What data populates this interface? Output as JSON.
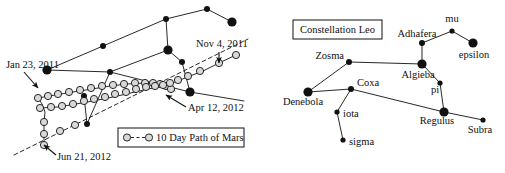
{
  "figure": {
    "background_color": "#ffffff",
    "ink_color": "#111111",
    "width": 505,
    "height": 173
  },
  "left_panel": {
    "name": "mars-path-panel",
    "date_labels": [
      {
        "id": "nov-4-2011",
        "text": "Nov 4, 2011",
        "x": 196,
        "y": 47,
        "anchor": "start",
        "arrow_from": [
          219,
          52
        ],
        "arrow_to": [
          219,
          63
        ]
      },
      {
        "id": "jan-23-2011",
        "text": "Jan 23, 2011",
        "x": 6,
        "y": 68,
        "anchor": "start",
        "arrow_from": [
          24,
          72
        ],
        "arrow_to": [
          38,
          88
        ]
      },
      {
        "id": "apr-12-2012",
        "text": "Apr 12, 2012",
        "x": 188,
        "y": 111,
        "anchor": "start",
        "arrow_from": [
          186,
          107
        ],
        "arrow_to": [
          166,
          95
        ]
      },
      {
        "id": "jun-21-2012",
        "text": "Jun 21, 2012",
        "x": 57,
        "y": 160,
        "anchor": "start",
        "arrow_from": [
          56,
          155
        ],
        "arrow_to": [
          44,
          145
        ]
      }
    ],
    "legend": {
      "label": "10 Day Path of Mars",
      "marker_style": "open-circle-dashed-open-circle",
      "box": {
        "x": 118,
        "y": 128,
        "width": 126,
        "height": 19
      }
    },
    "bright_stars": [
      {
        "id": "ls1",
        "x": 47,
        "y": 70,
        "r": 4.6
      },
      {
        "id": "ls2",
        "x": 103,
        "y": 46,
        "r": 3.0
      },
      {
        "id": "ls3",
        "x": 166,
        "y": 19,
        "r": 3.0
      },
      {
        "id": "ls4",
        "x": 207,
        "y": 9,
        "r": 3.0
      },
      {
        "id": "ls5",
        "x": 232,
        "y": 22,
        "r": 4.6
      },
      {
        "id": "ls6",
        "x": 168,
        "y": 50,
        "r": 4.6
      },
      {
        "id": "ls7",
        "x": 182,
        "y": 62,
        "r": 3.0
      },
      {
        "id": "ls8",
        "x": 190,
        "y": 92,
        "r": 4.6
      },
      {
        "id": "ls9",
        "x": 110,
        "y": 72,
        "r": 3.0
      },
      {
        "id": "ls10",
        "x": 84,
        "y": 96,
        "r": 3.0
      },
      {
        "id": "ls11",
        "x": 87,
        "y": 124,
        "r": 3.0
      }
    ],
    "constellation_segments": [
      [
        47,
        70,
        103,
        46
      ],
      [
        103,
        46,
        166,
        19
      ],
      [
        166,
        19,
        207,
        9
      ],
      [
        207,
        9,
        232,
        22
      ],
      [
        166,
        19,
        168,
        50
      ],
      [
        168,
        50,
        182,
        62
      ],
      [
        182,
        62,
        190,
        92
      ],
      [
        168,
        50,
        110,
        72
      ],
      [
        110,
        72,
        47,
        70
      ],
      [
        110,
        72,
        87,
        124
      ],
      [
        87,
        124,
        84,
        96
      ],
      [
        110,
        72,
        190,
        92
      ],
      [
        190,
        92,
        244,
        101
      ]
    ],
    "ecliptic": {
      "id": "ecliptic-dashed-line",
      "points": [
        [
          14,
          155
        ],
        [
          248,
          39
        ]
      ]
    },
    "mars_path_upper": [
      [
        38,
        98
      ],
      [
        55,
        95
      ],
      [
        73,
        92
      ],
      [
        92,
        89
      ],
      [
        110,
        86
      ],
      [
        127,
        84
      ],
      [
        144,
        83
      ],
      [
        157,
        83
      ],
      [
        166,
        85
      ],
      [
        172,
        88
      ],
      [
        175,
        91
      ]
    ],
    "mars_path_lower": [
      [
        40,
        108
      ],
      [
        58,
        107
      ],
      [
        76,
        104
      ],
      [
        93,
        101
      ],
      [
        108,
        98
      ],
      [
        122,
        95
      ],
      [
        135,
        92
      ],
      [
        148,
        89
      ],
      [
        158,
        87
      ],
      [
        166,
        85
      ],
      [
        172,
        83
      ],
      [
        180,
        80
      ],
      [
        190,
        76
      ],
      [
        203,
        71
      ],
      [
        219,
        63
      ],
      [
        236,
        55
      ]
    ],
    "mars_path_tail": [
      [
        38,
        98
      ],
      [
        42,
        104
      ],
      [
        45,
        112
      ],
      [
        44,
        122
      ],
      [
        44,
        134
      ],
      [
        44,
        145
      ]
    ],
    "mars_markers_upper": [
      [
        38,
        98
      ],
      [
        48,
        96
      ],
      [
        58,
        94
      ],
      [
        69,
        92
      ],
      [
        80,
        90
      ],
      [
        91,
        88
      ],
      [
        102,
        86
      ],
      [
        113,
        85
      ],
      [
        124,
        84
      ],
      [
        135,
        83
      ],
      [
        145,
        83
      ],
      [
        153,
        83
      ],
      [
        160,
        84
      ],
      [
        166,
        86
      ],
      [
        171,
        89
      ]
    ],
    "mars_markers_lower": [
      [
        40,
        108
      ],
      [
        51,
        107
      ],
      [
        62,
        106
      ],
      [
        73,
        104
      ],
      [
        84,
        101
      ],
      [
        94,
        99
      ],
      [
        105,
        97
      ],
      [
        115,
        94
      ],
      [
        126,
        92
      ],
      [
        136,
        89
      ],
      [
        146,
        87
      ],
      [
        155,
        86
      ],
      [
        163,
        85
      ],
      [
        170,
        83
      ],
      [
        178,
        80
      ],
      [
        188,
        76
      ],
      [
        200,
        71
      ],
      [
        219,
        63
      ],
      [
        236,
        55
      ]
    ],
    "mars_markers_tail": [
      [
        44,
        122
      ],
      [
        44,
        134
      ],
      [
        44,
        145
      ],
      [
        60,
        131
      ],
      [
        75,
        125
      ]
    ]
  },
  "right_panel": {
    "name": "constellation-leo-panel",
    "title": "Constellation Leo",
    "title_box": {
      "x": 293,
      "y": 20,
      "width": 89,
      "height": 19
    },
    "stars": [
      {
        "name": "Zosma",
        "x": 349,
        "y": 62,
        "r": 3.0,
        "label_x": 344,
        "label_y": 59,
        "label_anchor": "end",
        "magnitude": "bright"
      },
      {
        "name": "Denebola",
        "x": 308,
        "y": 92,
        "r": 4.6,
        "label_x": 303,
        "label_y": 105,
        "label_anchor": "middle",
        "magnitude": "bright"
      },
      {
        "name": "Coxa",
        "x": 351,
        "y": 89,
        "r": 3.0,
        "label_x": 357,
        "label_y": 86,
        "label_anchor": "start",
        "magnitude": "medium"
      },
      {
        "name": "iota",
        "x": 337,
        "y": 112,
        "r": 2.6,
        "label_x": 343,
        "label_y": 117,
        "label_anchor": "start",
        "magnitude": "small"
      },
      {
        "name": "sigma",
        "x": 343,
        "y": 140,
        "r": 2.6,
        "label_x": 349,
        "label_y": 145,
        "label_anchor": "start",
        "magnitude": "small"
      },
      {
        "name": "Algieba",
        "x": 422,
        "y": 64,
        "r": 4.6,
        "label_x": 418,
        "label_y": 78,
        "label_anchor": "middle",
        "magnitude": "bright"
      },
      {
        "name": "Adhafera",
        "x": 422,
        "y": 43,
        "r": 3.0,
        "label_x": 417,
        "label_y": 37,
        "label_anchor": "middle",
        "magnitude": "medium"
      },
      {
        "name": "mu",
        "x": 452,
        "y": 31,
        "r": 2.6,
        "label_x": 452,
        "label_y": 22,
        "label_anchor": "middle",
        "magnitude": "small"
      },
      {
        "name": "epsilon",
        "x": 473,
        "y": 43,
        "r": 4.6,
        "label_x": 474,
        "label_y": 58,
        "label_anchor": "middle",
        "magnitude": "bright"
      },
      {
        "name": "pi",
        "x": 440,
        "y": 83,
        "r": 2.6,
        "label_x": 435,
        "label_y": 93,
        "label_anchor": "middle",
        "magnitude": "small"
      },
      {
        "name": "Regulus",
        "x": 444,
        "y": 112,
        "r": 4.6,
        "label_x": 437,
        "label_y": 124,
        "label_anchor": "middle",
        "magnitude": "bright"
      },
      {
        "name": "Subra",
        "x": 483,
        "y": 120,
        "r": 2.6,
        "label_x": 480,
        "label_y": 133,
        "label_anchor": "middle",
        "magnitude": "small"
      }
    ],
    "segments": [
      [
        "Zosma",
        "Algieba"
      ],
      [
        "Zosma",
        "Denebola"
      ],
      [
        "Denebola",
        "Coxa"
      ],
      [
        "Coxa",
        "iota"
      ],
      [
        "iota",
        "sigma"
      ],
      [
        "Coxa",
        "Regulus"
      ],
      [
        "Algieba",
        "Adhafera"
      ],
      [
        "Adhafera",
        "mu"
      ],
      [
        "mu",
        "epsilon"
      ],
      [
        "Algieba",
        "pi"
      ],
      [
        "pi",
        "Regulus"
      ],
      [
        "Regulus",
        "Subra"
      ]
    ]
  }
}
